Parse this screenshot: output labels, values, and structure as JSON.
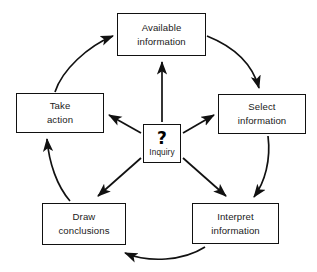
{
  "diagram": {
    "stroke_color": "#111111",
    "background_color": "#ffffff",
    "nodes": [
      {
        "id": "available",
        "label_line1": "Available",
        "label_line2": "information"
      },
      {
        "id": "select",
        "label_line1": "Select",
        "label_line2": "information"
      },
      {
        "id": "interpret",
        "label_line1": "Interpret",
        "label_line2": "information"
      },
      {
        "id": "draw",
        "label_line1": "Draw",
        "label_line2": "conclusions"
      },
      {
        "id": "take",
        "label_line1": "Take",
        "label_line2": "action"
      }
    ],
    "center": {
      "id": "inquiry",
      "symbol": "?",
      "label": "Inquiry"
    },
    "cycle_edges": [
      {
        "from": "take",
        "to": "available",
        "style": "curved"
      },
      {
        "from": "available",
        "to": "select",
        "style": "curved"
      },
      {
        "from": "select",
        "to": "interpret",
        "style": "curved"
      },
      {
        "from": "interpret",
        "to": "draw",
        "style": "curved"
      },
      {
        "from": "draw",
        "to": "take",
        "style": "curved"
      }
    ],
    "spoke_edges": [
      {
        "from": "inquiry",
        "to": "available",
        "style": "straight"
      },
      {
        "from": "inquiry",
        "to": "select",
        "style": "straight"
      },
      {
        "from": "inquiry",
        "to": "take",
        "style": "straight"
      },
      {
        "from": "inquiry",
        "to": "draw",
        "style": "straight"
      },
      {
        "from": "inquiry",
        "to": "interpret",
        "style": "straight"
      }
    ]
  }
}
